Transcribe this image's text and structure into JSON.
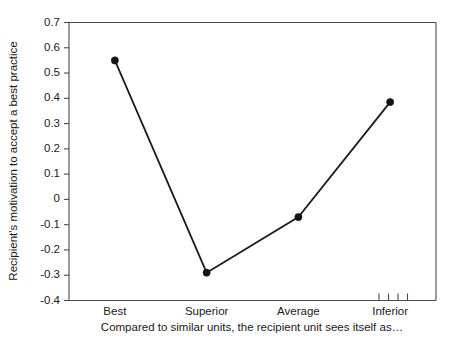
{
  "chart_data": {
    "type": "line",
    "title": "",
    "categories": [
      "Best",
      "Superior",
      "Average",
      "Inferior"
    ],
    "values": [
      0.55,
      -0.29,
      -0.07,
      0.385
    ],
    "series": [
      {
        "name": "Recipient's motivation to accept a best practice",
        "values": [
          0.55,
          -0.29,
          -0.07,
          0.385
        ]
      }
    ],
    "xlabel": "Compared to similar units, the recipient unit sees itself as…",
    "ylabel": "Recipient's motivation to accept a best practice",
    "ylim": [
      -0.4,
      0.7
    ],
    "ytick_labels": [
      "0.7",
      "0.6",
      "0.5",
      "0.4",
      "0.3",
      "0.2",
      "0.1",
      "0",
      "-0.1",
      "-0.2",
      "-0.3",
      "-0.4"
    ],
    "ytick_values": [
      0.7,
      0.6,
      0.5,
      0.4,
      0.3,
      0.2,
      0.1,
      0,
      -0.1,
      -0.2,
      -0.3,
      -0.4
    ],
    "grid": false,
    "legend": "none",
    "marker": "filled-circle",
    "line_color": "#1c1c1c",
    "marker_color": "#141414",
    "axis_color": "#4a4a4a",
    "background": "#ffffff",
    "minor_ticks_right": 4
  }
}
